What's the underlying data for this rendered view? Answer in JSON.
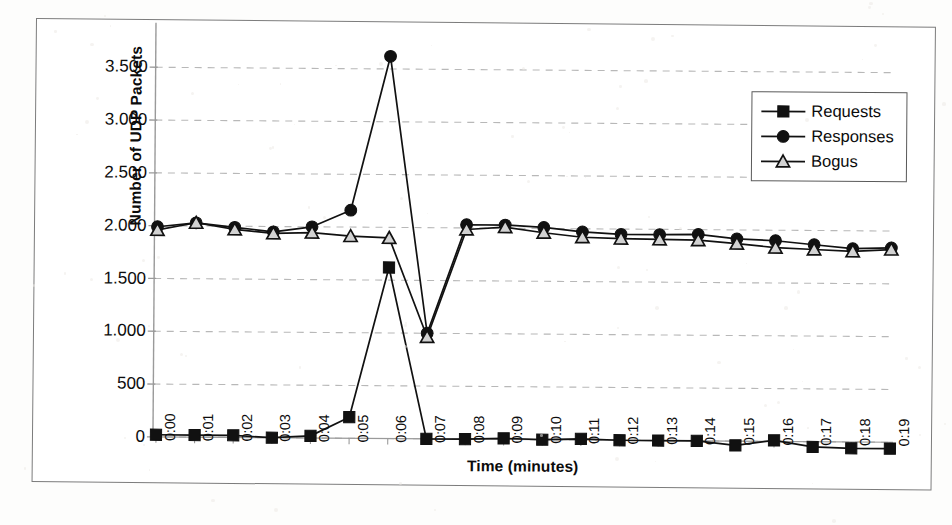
{
  "figure": {
    "caption_visible": false
  },
  "chart_data": {
    "type": "line",
    "title": "",
    "xlabel": "Time (minutes)",
    "ylabel": "Number of UDP Packets",
    "grid": true,
    "grid_axis": "y",
    "legend_position": "top-right",
    "ylim": [
      0,
      3750
    ],
    "yticks": [
      0,
      500,
      1000,
      1500,
      2000,
      2500,
      3000,
      3500
    ],
    "ytick_labels": [
      "0",
      "500",
      "1.000",
      "1.500",
      "2.000",
      "2.500",
      "3.000",
      "3.500"
    ],
    "categories": [
      "0:00",
      "0:01",
      "0:02",
      "0:03",
      "0:04",
      "0:05",
      "0:06",
      "0:07",
      "0:08",
      "0:09",
      "0:10",
      "0:11",
      "0:12",
      "0:13",
      "0:14",
      "0:15",
      "0:16",
      "0:17",
      "0:18",
      "0:19"
    ],
    "series": [
      {
        "name": "Requests",
        "marker": "filled-square",
        "color": "#111111",
        "values": [
          20,
          20,
          20,
          0,
          20,
          200,
          1620,
          0,
          0,
          10,
          0,
          10,
          0,
          0,
          0,
          -40,
          10,
          -50,
          -60,
          -60
        ]
      },
      {
        "name": "Responses",
        "marker": "filled-circle",
        "color": "#111111",
        "values": [
          1990,
          2030,
          1990,
          1950,
          2000,
          2160,
          3620,
          1000,
          2030,
          2030,
          2010,
          1970,
          1950,
          1950,
          1955,
          1915,
          1900,
          1865,
          1830,
          1840
        ]
      },
      {
        "name": "Bogus",
        "marker": "open-triangle",
        "color": "#111111",
        "values": [
          1960,
          2030,
          1970,
          1935,
          1945,
          1915,
          1900,
          965,
          1985,
          2010,
          1960,
          1920,
          1910,
          1905,
          1900,
          1870,
          1835,
          1820,
          1805,
          1825
        ]
      }
    ]
  },
  "legend": {
    "items": [
      {
        "label": "Requests",
        "marker": "filled-square"
      },
      {
        "label": "Responses",
        "marker": "filled-circle"
      },
      {
        "label": "Bogus",
        "marker": "open-triangle"
      }
    ]
  },
  "colors": {
    "ink": "#111111",
    "grid": "#b8b8b8",
    "axis": "#9a9a9a",
    "frame": "#7c7c7c",
    "marker_fill_open": "#d2d2d2"
  }
}
